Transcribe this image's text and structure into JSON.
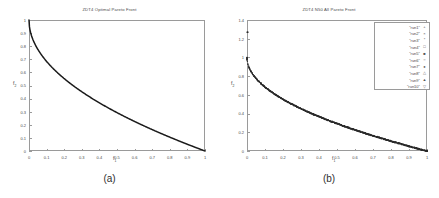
{
  "figure": {
    "background": "#ffffff",
    "panels": [
      {
        "caption": "(a)",
        "title": "ZDT4 Optimal Pareto Front",
        "xlabel": "f",
        "xlabel_sub": "1",
        "ylabel": "f",
        "ylabel_sub": "2",
        "xticks": [
          "0",
          "0.1",
          "0.2",
          "0.3",
          "0.4",
          "0.5",
          "0.6",
          "0.7",
          "0.8",
          "0.9",
          "1"
        ],
        "yticks": [
          "0",
          "0.1",
          "0.2",
          "0.3",
          "0.4",
          "0.5",
          "0.6",
          "0.7",
          "0.8",
          "0.9",
          "1"
        ]
      },
      {
        "caption": "(b)",
        "title": "ZDT4 N50 All Pareto Front",
        "xlabel": "f",
        "xlabel_sub": "1",
        "ylabel": "f",
        "ylabel_sub": "2",
        "xticks": [
          "0",
          "0.1",
          "0.2",
          "0.3",
          "0.4",
          "0.5",
          "0.6",
          "0.7",
          "0.8",
          "0.9",
          "1"
        ],
        "yticks": [
          "0",
          "0.2",
          "0.4",
          "0.6",
          "0.8",
          "1",
          "1.2",
          "1.4"
        ],
        "legend": [
          {
            "label": "\"run1\"",
            "marker": "+"
          },
          {
            "label": "\"run2\"",
            "marker": "×"
          },
          {
            "label": "\"run3\"",
            "marker": "*"
          },
          {
            "label": "\"run4\"",
            "marker": "□"
          },
          {
            "label": "\"run5\"",
            "marker": "■"
          },
          {
            "label": "\"run6\"",
            "marker": "○"
          },
          {
            "label": "\"run7\"",
            "marker": "●"
          },
          {
            "label": "\"run8\"",
            "marker": "△"
          },
          {
            "label": "\"run9\"",
            "marker": "▲"
          },
          {
            "label": "\"run10\"",
            "marker": "▽"
          }
        ]
      }
    ]
  },
  "chart_data": [
    {
      "type": "line",
      "title": "ZDT4 Optimal Pareto Front",
      "xlabel": "f1",
      "ylabel": "f2",
      "xlim": [
        0,
        1
      ],
      "ylim": [
        0,
        1
      ],
      "grid": false,
      "legend": "none",
      "xticks": [
        0,
        0.1,
        0.2,
        0.3,
        0.4,
        0.5,
        0.6,
        0.7,
        0.8,
        0.9,
        1
      ],
      "yticks": [
        0,
        0.1,
        0.2,
        0.3,
        0.4,
        0.5,
        0.6,
        0.7,
        0.8,
        0.9,
        1
      ],
      "series": [
        {
          "name": "optimal pareto front",
          "color": "#1a1a1a",
          "description": "f2 = 1 - sqrt(f1)",
          "x": [
            0,
            0.01,
            0.02,
            0.04,
            0.06,
            0.08,
            0.1,
            0.15,
            0.2,
            0.25,
            0.3,
            0.35,
            0.4,
            0.45,
            0.5,
            0.55,
            0.6,
            0.65,
            0.7,
            0.75,
            0.8,
            0.85,
            0.9,
            0.95,
            1
          ],
          "y": [
            1,
            0.9,
            0.859,
            0.8,
            0.755,
            0.717,
            0.684,
            0.613,
            0.553,
            0.5,
            0.452,
            0.408,
            0.368,
            0.329,
            0.293,
            0.258,
            0.225,
            0.194,
            0.163,
            0.134,
            0.106,
            0.078,
            0.051,
            0.025,
            0
          ]
        }
      ]
    },
    {
      "type": "scatter",
      "title": "ZDT4 N50 All Pareto Front",
      "xlabel": "f1",
      "ylabel": "f2",
      "xlim": [
        0,
        1
      ],
      "ylim": [
        0,
        1.4
      ],
      "grid": false,
      "legend": "upper right",
      "xticks": [
        0,
        0.1,
        0.2,
        0.3,
        0.4,
        0.5,
        0.6,
        0.7,
        0.8,
        0.9,
        1
      ],
      "yticks": [
        0,
        0.2,
        0.4,
        0.6,
        0.8,
        1.0,
        1.2,
        1.4
      ],
      "note": "10 runs overlapping along f2 = 1 - sqrt(f1); one outlier near (0, 1.27)",
      "series": [
        {
          "name": "\"run1\"",
          "marker": "+",
          "x": [
            0,
            0.02,
            0.05,
            0.1,
            0.16,
            0.22,
            0.3,
            0.38,
            0.46,
            0.55,
            0.64,
            0.73,
            0.82,
            0.91,
            1
          ],
          "y": [
            0.98,
            0.859,
            0.777,
            0.684,
            0.6,
            0.531,
            0.452,
            0.384,
            0.322,
            0.258,
            0.2,
            0.145,
            0.095,
            0.046,
            0
          ]
        },
        {
          "name": "\"run2\"",
          "marker": "×",
          "x": [
            0,
            0.03,
            0.07,
            0.13,
            0.19,
            0.26,
            0.34,
            0.42,
            0.51,
            0.6,
            0.69,
            0.78,
            0.87,
            0.95,
            1
          ],
          "y": [
            0.985,
            0.827,
            0.735,
            0.639,
            0.564,
            0.49,
            0.417,
            0.352,
            0.286,
            0.225,
            0.169,
            0.117,
            0.067,
            0.025,
            0
          ]
        },
        {
          "name": "\"run3\"",
          "marker": "*",
          "x": [
            0,
            0.025,
            0.06,
            0.11,
            0.17,
            0.24,
            0.32,
            0.4,
            0.49,
            0.58,
            0.67,
            0.76,
            0.85,
            0.93,
            1
          ],
          "y": [
            1.27,
            0.842,
            0.755,
            0.668,
            0.588,
            0.51,
            0.434,
            0.368,
            0.3,
            0.239,
            0.181,
            0.128,
            0.078,
            0.036,
            0
          ]
        },
        {
          "name": "\"run4\"",
          "marker": "□",
          "x": [
            0,
            0.015,
            0.045,
            0.09,
            0.15,
            0.21,
            0.29,
            0.37,
            0.45,
            0.54,
            0.63,
            0.72,
            0.81,
            0.9,
            1
          ],
          "y": [
            0.99,
            0.878,
            0.788,
            0.7,
            0.613,
            0.542,
            0.461,
            0.392,
            0.329,
            0.265,
            0.206,
            0.151,
            0.1,
            0.051,
            0
          ]
        },
        {
          "name": "\"run5\"",
          "marker": "■",
          "x": [
            0,
            0.035,
            0.08,
            0.14,
            0.2,
            0.28,
            0.36,
            0.44,
            0.53,
            0.62,
            0.71,
            0.8,
            0.89,
            0.96,
            1
          ],
          "y": [
            0.975,
            0.813,
            0.717,
            0.626,
            0.553,
            0.471,
            0.4,
            0.337,
            0.272,
            0.213,
            0.157,
            0.106,
            0.057,
            0.02,
            0
          ]
        },
        {
          "name": "\"run6\"",
          "marker": "○",
          "x": [
            0,
            0.02,
            0.055,
            0.105,
            0.165,
            0.23,
            0.31,
            0.39,
            0.48,
            0.57,
            0.66,
            0.75,
            0.84,
            0.92,
            1
          ],
          "y": [
            0.982,
            0.859,
            0.765,
            0.676,
            0.594,
            0.52,
            0.443,
            0.376,
            0.307,
            0.245,
            0.188,
            0.134,
            0.083,
            0.041,
            0
          ]
        },
        {
          "name": "\"run7\"",
          "marker": "●",
          "x": [
            0,
            0.04,
            0.085,
            0.145,
            0.21,
            0.285,
            0.365,
            0.45,
            0.54,
            0.63,
            0.72,
            0.81,
            0.895,
            0.97,
            1
          ],
          "y": [
            0.97,
            0.8,
            0.708,
            0.619,
            0.542,
            0.466,
            0.396,
            0.329,
            0.265,
            0.206,
            0.151,
            0.1,
            0.054,
            0.015,
            0
          ]
        },
        {
          "name": "\"run8\"",
          "marker": "△",
          "x": [
            0,
            0.012,
            0.05,
            0.1,
            0.155,
            0.225,
            0.305,
            0.385,
            0.47,
            0.56,
            0.65,
            0.74,
            0.83,
            0.915,
            1
          ],
          "y": [
            0.993,
            0.89,
            0.777,
            0.684,
            0.606,
            0.526,
            0.448,
            0.38,
            0.314,
            0.252,
            0.194,
            0.14,
            0.089,
            0.043,
            0
          ]
        },
        {
          "name": "\"run9\"",
          "marker": "▲",
          "x": [
            0,
            0.03,
            0.065,
            0.12,
            0.18,
            0.25,
            0.33,
            0.41,
            0.5,
            0.59,
            0.68,
            0.77,
            0.86,
            0.94,
            1
          ],
          "y": [
            0.978,
            0.827,
            0.745,
            0.654,
            0.576,
            0.5,
            0.426,
            0.36,
            0.293,
            0.232,
            0.175,
            0.123,
            0.073,
            0.03,
            0
          ]
        },
        {
          "name": "\"run10\"",
          "marker": "▽",
          "x": [
            0,
            0.018,
            0.07,
            0.125,
            0.19,
            0.26,
            0.34,
            0.43,
            0.52,
            0.61,
            0.7,
            0.79,
            0.88,
            0.955,
            1
          ],
          "y": [
            0.987,
            0.866,
            0.735,
            0.646,
            0.564,
            0.49,
            0.417,
            0.344,
            0.279,
            0.219,
            0.163,
            0.111,
            0.062,
            0.023,
            0
          ]
        }
      ]
    }
  ]
}
